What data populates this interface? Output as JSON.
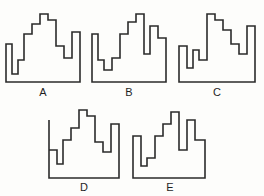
{
  "figure": {
    "background_color": "#fdfdfb",
    "stroke_color": "#2b2b2b",
    "label_color": "#1f1f1f",
    "shape_count": 5,
    "row_counts": [
      3,
      2
    ]
  },
  "shapes": [
    {
      "id": "A",
      "label": "A",
      "row": 1,
      "column": 1,
      "box": {
        "x": 4,
        "y": 12,
        "width": 78,
        "height": 72
      },
      "label_box": {
        "x": 4,
        "y": 86,
        "width": 78,
        "height": 14
      },
      "viewbox": "0 0 78 72",
      "outline_points": "2,32 2,70 76,70 76,20 68,20 68,46 60,46 60,34 52,34 52,8 44,8 44,2 36,2 36,12 28,12 28,22 20,22 20,48 14,48 14,62 8,62 8,32 2,32",
      "path": "M2,32 L2,70 L76,70 L76,20 L68,20 L68,46 L60,46 L60,34 L52,34 L52,8 L44,8 L44,2 L36,2 L36,12 L28,12 L28,22 L20,22 L20,48 L14,48 L14,62 L8,62 L8,32 Z"
    },
    {
      "id": "B",
      "label": "B",
      "row": 1,
      "column": 2,
      "box": {
        "x": 90,
        "y": 12,
        "width": 78,
        "height": 72
      },
      "label_box": {
        "x": 90,
        "y": 86,
        "width": 78,
        "height": 14
      },
      "viewbox": "0 0 78 72",
      "outline_points": "2,22 2,70 76,70 76,26 68,26 68,14 60,14 60,42 54,42 54,2 46,2 46,10 38,10 38,22 30,22 30,46 22,46 22,58 14,58 14,48 8,48 8,22 2,22",
      "path": "M2,22 L2,70 L76,70 L76,26 L68,26 L68,14 L60,14 L60,42 L54,42 L54,2 L46,2 L46,10 L38,10 L38,22 L30,22 L30,46 L22,46 L22,58 L14,58 L14,48 L8,48 L8,22 Z"
    },
    {
      "id": "C",
      "label": "C",
      "row": 1,
      "column": 3,
      "box": {
        "x": 177,
        "y": 12,
        "width": 80,
        "height": 72
      },
      "label_box": {
        "x": 177,
        "y": 86,
        "width": 80,
        "height": 14
      },
      "viewbox": "0 0 80 72",
      "outline_points": "2,34 2,70 78,70 78,14 70,14 70,42 62,42 62,32 54,32 54,18 46,18 46,8 38,8 38,2 30,2 30,48 22,48 22,38 16,38 16,56 10,56 10,34 2,34",
      "path": "M2,34 L2,70 L78,70 L78,14 L70,14 L70,42 L62,42 L62,32 L54,32 L54,18 L46,18 L46,8 L38,8 L38,2 L30,2 L30,48 L22,48 L22,38 L16,38 L16,56 L10,56 L10,34 Z"
    },
    {
      "id": "D",
      "label": "D",
      "row": 2,
      "column": 1,
      "box": {
        "x": 45,
        "y": 108,
        "width": 78,
        "height": 72
      },
      "label_box": {
        "x": 45,
        "y": 181,
        "width": 78,
        "height": 14
      },
      "viewbox": "0 0 78 72",
      "outline_points": "4,12 4,70 74,70 74,16 66,16 66,44 58,44 58,34 50,34 50,8 42,8 42,2 34,2 34,20 26,20 26,32 18,32 18,56 12,56 12,42 4,42 4,12",
      "path": "M4,12 L4,70 L74,70 L74,16 L66,16 L66,44 L58,44 L58,34 L50,34 L50,8 L42,8 L42,2 L34,2 L34,20 L26,20 L26,32 L18,32 L18,56 L12,56 L12,42 L4,42 Z"
    },
    {
      "id": "E",
      "label": "E",
      "row": 2,
      "column": 2,
      "box": {
        "x": 131,
        "y": 110,
        "width": 78,
        "height": 70
      },
      "label_box": {
        "x": 131,
        "y": 181,
        "width": 78,
        "height": 14
      },
      "viewbox": "0 0 78 70",
      "outline_points": "2,26 2,68 74,68 74,30 64,30 64,10 56,10 56,40 48,40 48,2 40,2 40,14 32,14 32,26 24,26 24,48 16,48 16,56 10,56 10,26 2,26",
      "path": "M2,26 L2,68 L74,68 L74,30 L64,30 L64,10 L56,10 L56,40 L48,40 L48,2 L40,2 L40,14 L32,14 L32,26 L24,26 L24,48 L16,48 L16,56 L10,56 L10,26 Z"
    }
  ]
}
